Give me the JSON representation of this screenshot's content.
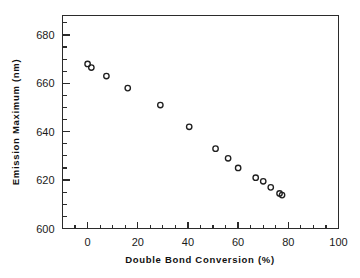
{
  "chart_data": {
    "type": "scatter",
    "title": "",
    "xlabel": "Double Bond Conversion (%)",
    "ylabel": "Emission Maximum (nm)",
    "xlim": [
      -10,
      100
    ],
    "ylim": [
      600,
      688
    ],
    "xticks": [
      0,
      20,
      40,
      60,
      80,
      100
    ],
    "xtick_labels": [
      "0",
      "20",
      "40",
      "60",
      "80",
      "100"
    ],
    "yticks": [
      600,
      620,
      640,
      660,
      680
    ],
    "ytick_labels": [
      "600",
      "620",
      "640",
      "660",
      "680"
    ],
    "x_minor_tick_step": 5,
    "y_minor_tick_step": 5,
    "grid": false,
    "legend": null,
    "marker": "open-circle",
    "series": [
      {
        "name": "Emission maximum vs double bond conversion",
        "points": [
          {
            "x": 0.0,
            "y": 668.0
          },
          {
            "x": 1.5,
            "y": 666.5
          },
          {
            "x": 7.5,
            "y": 663.0
          },
          {
            "x": 16.0,
            "y": 658.0
          },
          {
            "x": 29.0,
            "y": 651.0
          },
          {
            "x": 40.5,
            "y": 642.0
          },
          {
            "x": 51.0,
            "y": 633.0
          },
          {
            "x": 56.0,
            "y": 629.0
          },
          {
            "x": 60.0,
            "y": 625.0
          },
          {
            "x": 67.0,
            "y": 621.0
          },
          {
            "x": 70.0,
            "y": 619.5
          },
          {
            "x": 73.0,
            "y": 617.0
          },
          {
            "x": 76.5,
            "y": 614.5
          },
          {
            "x": 77.5,
            "y": 613.8
          }
        ]
      }
    ]
  },
  "axes": {
    "x_axis_name": "double-bond-conversion-axis",
    "y_axis_name": "emission-maximum-axis"
  }
}
